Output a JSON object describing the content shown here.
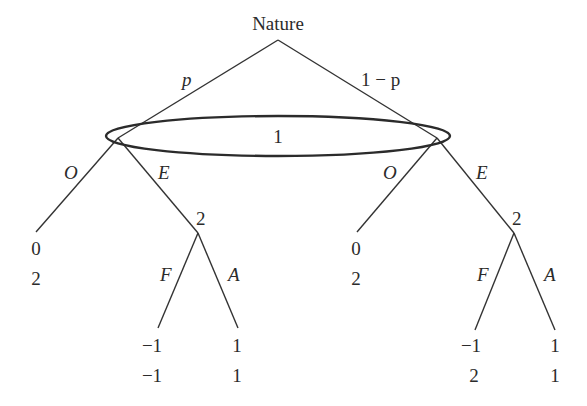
{
  "diagram": {
    "type": "game-tree",
    "root": {
      "label": "Nature"
    },
    "nature_branches": [
      {
        "label": "p"
      },
      {
        "label": "1 − p"
      }
    ],
    "information_set": {
      "player": "1"
    },
    "player1_actions": [
      "O",
      "E"
    ],
    "player2_label": "2",
    "player2_actions": [
      "F",
      "A"
    ],
    "left_subtree": {
      "O_payoff": [
        "0",
        "2"
      ],
      "F_payoff": [
        "−1",
        "−1"
      ],
      "A_payoff": [
        "1",
        "1"
      ]
    },
    "right_subtree": {
      "O_payoff": [
        "0",
        "2"
      ],
      "F_payoff": [
        "−1",
        "2"
      ],
      "A_payoff": [
        "1",
        "1"
      ]
    },
    "colors": {
      "line": "#333333",
      "text": "#2b2b2b",
      "background": "#ffffff"
    }
  }
}
